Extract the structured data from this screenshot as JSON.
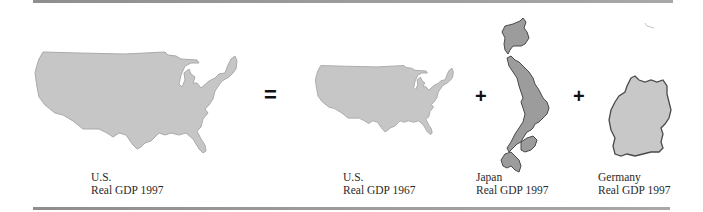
{
  "figure": {
    "equation": {
      "lhs": {
        "country": "U.S.",
        "measure": "Real GDP 1997",
        "map": "us-map-large"
      },
      "operators": [
        "=",
        "+",
        "+"
      ],
      "rhs": [
        {
          "country": "U.S.",
          "measure": "Real GDP 1967",
          "map": "us-map-small"
        },
        {
          "country": "Japan",
          "measure": "Real GDP 1997",
          "map": "japan-map"
        },
        {
          "country": "Germany",
          "measure": "Real GDP 1997",
          "map": "germany-map"
        }
      ]
    },
    "colors": {
      "us_fill": "#c6c6c6",
      "us_stroke": "#a9a9a9",
      "japan_fill": "#9c9c9c",
      "japan_stroke": "#4a4a4a",
      "germany_fill": "#c8c8c8",
      "germany_stroke": "#4a4a4a",
      "rule": "#969696",
      "text": "#2a2a2a"
    }
  }
}
